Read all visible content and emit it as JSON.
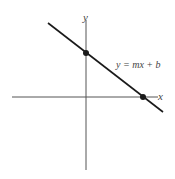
{
  "diagram": {
    "type": "linear-function-graph",
    "axes": {
      "x_label": "x",
      "y_label": "y"
    },
    "equation_label": "y = mx + b",
    "points": [
      {
        "name": "y-intercept",
        "description": "point where line crosses y-axis (0, b)"
      },
      {
        "name": "x-intercept",
        "description": "point where line crosses x-axis"
      }
    ],
    "line": {
      "slope_sign": "negative",
      "color": "#1a1a1a"
    },
    "colors": {
      "axis": "#555555",
      "line": "#1a1a1a",
      "text": "#444444",
      "background": "#ffffff"
    }
  }
}
